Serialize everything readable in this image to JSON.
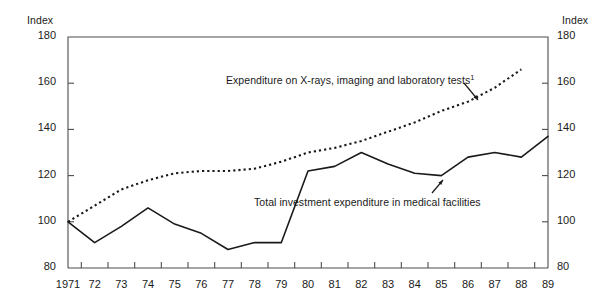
{
  "chart_data": {
    "type": "line",
    "title": "",
    "xlabel": "",
    "ylabel": "Index",
    "ylabel_right": "Index",
    "ylim": [
      80,
      180
    ],
    "yticks": [
      80,
      100,
      120,
      140,
      160,
      180
    ],
    "xlim": [
      1971,
      1989
    ],
    "grid": false,
    "legend": "inline-annotations",
    "x": [
      1971,
      1972,
      1973,
      1974,
      1975,
      1976,
      1977,
      1978,
      1979,
      1980,
      1981,
      1982,
      1983,
      1984,
      1985,
      1986,
      1987,
      1988,
      1989
    ],
    "xtick_labels": [
      "1971",
      "72",
      "73",
      "74",
      "75",
      "76",
      "77",
      "78",
      "79",
      "80",
      "81",
      "82",
      "83",
      "84",
      "85",
      "86",
      "87",
      "88",
      "89"
    ],
    "series": [
      {
        "name": "Expenditure on X-rays, imaging and laboratory tests",
        "footnote": "1",
        "style": "dotted",
        "color": "#1a1a1a",
        "x": [
          1971,
          1972,
          1973,
          1974,
          1975,
          1976,
          1977,
          1978,
          1979,
          1980,
          1981,
          1982,
          1983,
          1984,
          1985,
          1986,
          1987,
          1988
        ],
        "values": [
          100,
          107,
          114,
          118,
          121,
          122,
          122,
          123,
          126,
          130,
          132,
          135,
          139,
          143,
          148,
          152,
          158,
          166
        ]
      },
      {
        "name": "Total investment expenditure in medical facilities",
        "style": "solid",
        "color": "#1a1a1a",
        "x": [
          1971,
          1972,
          1973,
          1974,
          1975,
          1976,
          1977,
          1978,
          1979,
          1980,
          1981,
          1982,
          1983,
          1984,
          1985,
          1986,
          1987,
          1988,
          1989
        ],
        "values": [
          100,
          91,
          98,
          106,
          99,
          95,
          88,
          91,
          91,
          122,
          124,
          130,
          125,
          121,
          120,
          128,
          130,
          128,
          137
        ]
      }
    ],
    "annotations": [
      {
        "text": "Expenditure on X-rays, imaging and laboratory tests",
        "footnote": "1",
        "target_series": "Expenditure on X-rays, imaging and laboratory tests",
        "arrow": true
      },
      {
        "text": "Total investment expenditure in medical facilities",
        "target_series": "Total investment expenditure in medical facilities",
        "arrow": true
      }
    ]
  },
  "axis": {
    "left_title": "Index",
    "right_title": "Index",
    "yticks": [
      "180",
      "160",
      "140",
      "120",
      "100",
      "80"
    ],
    "xticks": [
      "1971",
      "72",
      "73",
      "74",
      "75",
      "76",
      "77",
      "78",
      "79",
      "80",
      "81",
      "82",
      "83",
      "84",
      "85",
      "86",
      "87",
      "88",
      "89"
    ]
  },
  "labels": {
    "xray_series": "Expenditure on X-rays, imaging and laboratory tests",
    "xray_footnote": "1",
    "investment_series": "Total investment expenditure in medical facilities"
  },
  "colors": {
    "line": "#1a1a1a",
    "frame": "#4d4d4d",
    "background": "#ffffff"
  }
}
